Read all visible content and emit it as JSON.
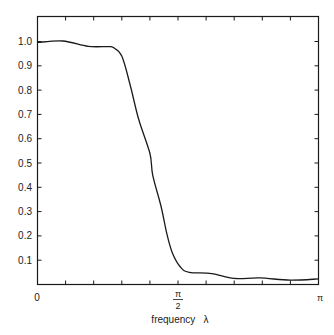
{
  "chart_data": {
    "type": "line",
    "title": "",
    "xlabel": "frequency λ",
    "ylabel": "",
    "xlim": [
      0,
      3.14159
    ],
    "ylim": [
      0,
      1.1
    ],
    "grid": false,
    "legend": null,
    "x_tick_labels": [
      {
        "value": 0,
        "label": "0"
      },
      {
        "value": 1.5708,
        "label": "π/2",
        "numerator": "π",
        "denominator": "2"
      },
      {
        "value": 3.14159,
        "label": "π"
      }
    ],
    "x_minor_ticks": 10,
    "y_ticks": [
      0.1,
      0.2,
      0.3,
      0.4,
      0.5,
      0.6,
      0.7,
      0.8,
      0.9,
      1.0
    ],
    "y_tick_labels": [
      "0.1",
      "0.2",
      "0.3",
      "0.4",
      "0.5",
      "0.6",
      "0.7",
      "0.8",
      "0.9",
      "1.0"
    ],
    "series": [
      {
        "name": "gain",
        "x_fraction_of_pi": [
          0.0,
          0.09,
          0.18,
          0.25,
          0.27,
          0.3,
          0.33,
          0.36,
          0.4,
          0.41,
          0.44,
          0.46,
          0.48,
          0.51,
          0.54,
          0.62,
          0.7,
          0.79,
          0.9,
          1.0
        ],
        "y": [
          0.996,
          1.002,
          0.98,
          0.979,
          0.975,
          0.94,
          0.82,
          0.68,
          0.54,
          0.45,
          0.32,
          0.21,
          0.13,
          0.07,
          0.05,
          0.045,
          0.025,
          0.027,
          0.018,
          0.023
        ]
      }
    ]
  },
  "labels": {
    "x_origin": "0",
    "x_mid_num": "π",
    "x_mid_den": "2",
    "x_end": "π",
    "x_axis_title": "frequency   λ"
  },
  "style": {
    "line_color": "#1a1a1a",
    "axis_color": "#1a1a1a",
    "background": "#ffffff"
  }
}
